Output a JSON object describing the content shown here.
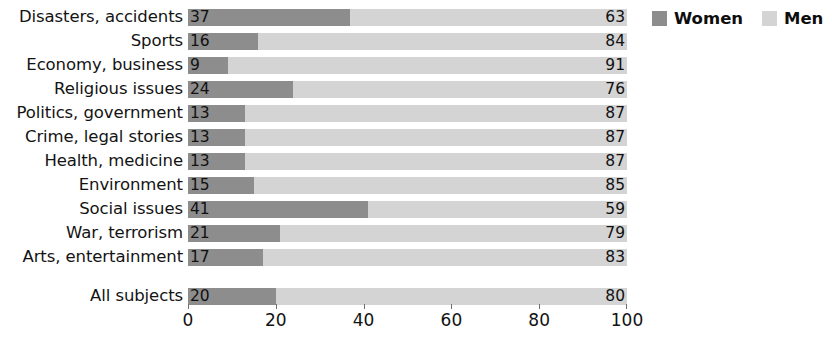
{
  "chart_data": {
    "type": "bar",
    "orientation": "horizontal",
    "stacked": true,
    "stacked_percent": true,
    "title": "",
    "subtitle": "",
    "xlabel": "",
    "ylabel": "",
    "xlim": [
      0,
      100
    ],
    "grid": false,
    "legend_position": "top-right",
    "categories": [
      "Disasters, accidents",
      "Sports",
      "Economy, business",
      "Religious issues",
      "Politics, government",
      "Crime, legal stories",
      "Health, medicine",
      "Environment",
      "Social issues",
      "War, terrorism",
      "Arts, entertainment"
    ],
    "summary_category": "All subjects",
    "series": [
      {
        "name": "Women",
        "color": "#8d8d8d",
        "values": [
          37,
          16,
          9,
          24,
          13,
          13,
          13,
          15,
          41,
          21,
          17
        ],
        "summary_value": 20
      },
      {
        "name": "Men",
        "color": "#d4d4d4",
        "values": [
          63,
          84,
          91,
          76,
          87,
          87,
          87,
          85,
          59,
          79,
          83
        ],
        "summary_value": 80
      }
    ],
    "xticks": [
      0,
      20,
      40,
      60,
      80,
      100
    ],
    "xticklabels": [
      "0",
      "20",
      "40",
      "60",
      "80",
      "100"
    ]
  },
  "legend": {
    "items": [
      {
        "label": "Women",
        "color": "#8d8d8d"
      },
      {
        "label": "Men",
        "color": "#d4d4d4"
      }
    ]
  },
  "rows": [
    {
      "label": "Disasters, accidents",
      "women": "37",
      "men": "63"
    },
    {
      "label": "Sports",
      "women": "16",
      "men": "84"
    },
    {
      "label": "Economy, business",
      "women": "9",
      "men": "91"
    },
    {
      "label": "Religious issues",
      "women": "24",
      "men": "76"
    },
    {
      "label": "Politics, government",
      "women": "13",
      "men": "87"
    },
    {
      "label": "Crime, legal stories",
      "women": "13",
      "men": "87"
    },
    {
      "label": "Health, medicine",
      "women": "13",
      "men": "87"
    },
    {
      "label": "Environment",
      "women": "15",
      "men": "85"
    },
    {
      "label": "Social issues",
      "women": "41",
      "men": "59"
    },
    {
      "label": "War, terrorism",
      "women": "21",
      "men": "79"
    },
    {
      "label": "Arts, entertainment",
      "women": "17",
      "men": "83"
    }
  ],
  "summary_row": {
    "label": "All subjects",
    "women": "20",
    "men": "80"
  },
  "axis": {
    "ticks": [
      "0",
      "20",
      "40",
      "60",
      "80",
      "100"
    ]
  }
}
